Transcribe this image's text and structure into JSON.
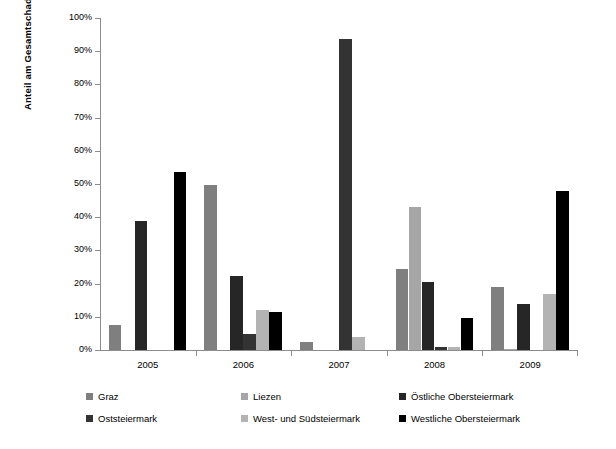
{
  "chart_data": {
    "type": "bar",
    "title": "",
    "subtitle": "",
    "xlabel": "",
    "ylabel": "Anteil am Gesamtschaden",
    "ylim": [
      0,
      100
    ],
    "ytick_labels": [
      "0%",
      "10%",
      "20%",
      "30%",
      "40%",
      "50%",
      "60%",
      "70%",
      "80%",
      "90%",
      "100%"
    ],
    "ytick_values": [
      0,
      10,
      20,
      30,
      40,
      50,
      60,
      70,
      80,
      90,
      100
    ],
    "grid": false,
    "legend_position": "bottom",
    "categories": [
      "2005",
      "2006",
      "2007",
      "2008",
      "2009"
    ],
    "series": [
      {
        "name": "Graz",
        "color": "#7f7f7f",
        "values": [
          7.5,
          49.8,
          2.3,
          24.3,
          19.0
        ]
      },
      {
        "name": "Liezen",
        "color": "#a6a6a6",
        "values": [
          0,
          0,
          0,
          43.0,
          0.4
        ]
      },
      {
        "name": "Östliche Obersteiermark",
        "color": "#262626",
        "values": [
          38.8,
          22.3,
          0,
          20.5,
          14.0
        ]
      },
      {
        "name": "Oststeiermark",
        "color": "#333333",
        "values": [
          0,
          4.8,
          93.8,
          1.0,
          0
        ]
      },
      {
        "name": "West- und Südsteiermark",
        "color": "#b3b3b3",
        "values": [
          0,
          12.0,
          3.8,
          1.0,
          17.0
        ]
      },
      {
        "name": "Westliche Obersteiermark",
        "color": "#000000",
        "values": [
          53.5,
          11.5,
          0,
          9.5,
          48.0
        ]
      }
    ]
  },
  "legend": {
    "rows": [
      [
        {
          "label": "Graz",
          "color": "#7f7f7f"
        },
        {
          "label": "Liezen",
          "color": "#a6a6a6"
        },
        {
          "label": "Östliche Obersteiermark",
          "color": "#262626"
        }
      ],
      [
        {
          "label": "Oststeiermark",
          "color": "#333333"
        },
        {
          "label": "West- und Südsteiermark",
          "color": "#b3b3b3"
        },
        {
          "label": "Westliche Obersteiermark",
          "color": "#000000"
        }
      ]
    ]
  }
}
